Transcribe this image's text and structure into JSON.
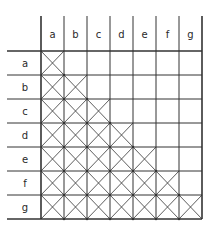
{
  "diagram": {
    "type": "pairwise-matrix",
    "column_labels": [
      "a",
      "b",
      "c",
      "d",
      "e",
      "f",
      "g"
    ],
    "row_labels": [
      "a",
      "b",
      "c",
      "d",
      "e",
      "f",
      "g"
    ],
    "filled_region": "lower-triangle-including-diagonal",
    "cell_mark": "X",
    "colors": {
      "line": "#333333",
      "background": "#ffffff"
    }
  }
}
